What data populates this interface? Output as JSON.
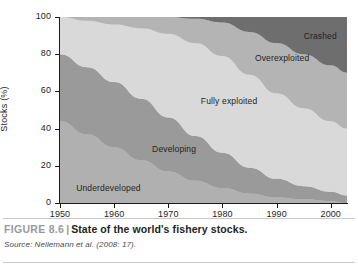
{
  "figure": {
    "number_label": "FIGURE 8.6",
    "separator": "|",
    "title": "State of the world's fishery stocks.",
    "source": "Source: Nellemann et al. (2008: 17)."
  },
  "chart_data": {
    "type": "area",
    "title": "State of the world's fishery stocks.",
    "xlabel": "",
    "ylabel": "Stocks (%)",
    "xlim": [
      1950,
      2003
    ],
    "ylim": [
      0,
      100
    ],
    "grid": false,
    "legend_position": "inline-labels",
    "stacked": true,
    "stack_order": "bottom-to-top",
    "xticks": [
      1950,
      1960,
      1970,
      1980,
      1990,
      2000
    ],
    "xtick_labels": [
      "1950",
      "1960",
      "1970",
      "1980",
      "1990",
      "2000"
    ],
    "yticks": [
      0,
      20,
      40,
      60,
      80,
      100
    ],
    "ytick_labels": [
      "0",
      "20",
      "40",
      "60",
      "80",
      "100"
    ],
    "x": [
      1950,
      1955,
      1960,
      1965,
      1970,
      1975,
      1980,
      1985,
      1990,
      1995,
      2000,
      2003
    ],
    "series": [
      {
        "name": "Underdeveloped",
        "color": "#b0b0b0",
        "values": [
          44,
          37,
          30,
          23,
          17,
          12,
          8,
          5,
          3,
          2,
          1,
          0
        ],
        "label_x": 1953,
        "label_y": 8
      },
      {
        "name": "Developing",
        "color": "#9a9a9a",
        "values": [
          36,
          36,
          35,
          33,
          29,
          24,
          19,
          14,
          10,
          7,
          5,
          4
        ],
        "label_x": 1967,
        "label_y": 29
      },
      {
        "name": "Fully exploited",
        "color": "#d9d9d9",
        "values": [
          20,
          25,
          31,
          38,
          45,
          50,
          52,
          50,
          46,
          42,
          38,
          36
        ],
        "label_x": 1976,
        "label_y": 55
      },
      {
        "name": "Overexploited",
        "color": "#b4b4b4",
        "values": [
          0,
          2,
          4,
          6,
          9,
          13,
          18,
          23,
          27,
          29,
          30,
          30
        ],
        "label_x": 1986,
        "label_y": 78
      },
      {
        "name": "Crashed",
        "color": "#6e6e6e",
        "values": [
          0,
          0,
          0,
          0,
          0,
          1,
          3,
          8,
          14,
          20,
          26,
          30
        ],
        "label_x": 1995,
        "label_y": 90
      }
    ]
  },
  "axis": {
    "y_title": "Stocks (%)"
  },
  "bands": [
    {
      "label": "Underdeveloped"
    },
    {
      "label": "Developing"
    },
    {
      "label": "Fully exploited"
    },
    {
      "label": "Overexploited"
    },
    {
      "label": "Crashed"
    }
  ],
  "colors": {
    "underdeveloped": "#b0b0b0",
    "developing": "#9a9a9a",
    "fully_exploited": "#d9d9d9",
    "overexploited": "#b4b4b4",
    "crashed": "#6e6e6e",
    "axis": "#1a1a1a",
    "text": "#231f20",
    "caption_muted": "#9a9a9a",
    "rule": "#c9c9c9"
  }
}
